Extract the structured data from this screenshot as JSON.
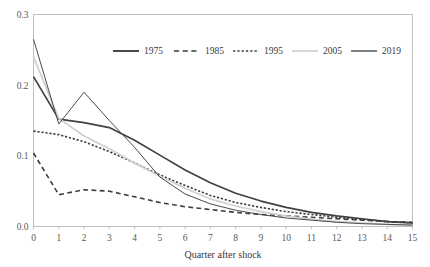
{
  "chart_data": {
    "type": "line",
    "title": "",
    "xlabel": "Quarter after shock",
    "ylabel": "",
    "xlim": [
      0,
      15
    ],
    "ylim": [
      0.0,
      0.3
    ],
    "grid": false,
    "legend_position": "top-center",
    "x": [
      0,
      1,
      2,
      3,
      4,
      5,
      6,
      7,
      8,
      9,
      10,
      11,
      12,
      13,
      14,
      15
    ],
    "xtick_labels": [
      "0",
      "1",
      "2",
      "3",
      "4",
      "5",
      "6",
      "7",
      "8",
      "9",
      "10",
      "11",
      "12",
      "13",
      "14",
      "15"
    ],
    "ytick_labels": [
      "0.0",
      "0.1",
      "0.2",
      "0.3"
    ],
    "ytick_values": [
      0.0,
      0.1,
      0.2,
      0.3
    ],
    "series": [
      {
        "name": "1975",
        "style": "solid",
        "color": "#404040",
        "width": 1.7,
        "values": [
          0.212,
          0.152,
          0.147,
          0.14,
          0.122,
          0.101,
          0.08,
          0.062,
          0.047,
          0.036,
          0.027,
          0.02,
          0.015,
          0.011,
          0.007,
          0.005
        ]
      },
      {
        "name": "1985",
        "style": "dashed",
        "color": "#3d3d3d",
        "width": 1.6,
        "values": [
          0.104,
          0.045,
          0.052,
          0.05,
          0.042,
          0.034,
          0.028,
          0.024,
          0.02,
          0.017,
          0.015,
          0.013,
          0.011,
          0.009,
          0.007,
          0.006
        ]
      },
      {
        "name": "1995",
        "style": "dotted",
        "color": "#3d3d3d",
        "width": 1.6,
        "values": [
          0.135,
          0.13,
          0.12,
          0.106,
          0.09,
          0.073,
          0.058,
          0.044,
          0.034,
          0.027,
          0.021,
          0.017,
          0.013,
          0.01,
          0.007,
          0.005
        ]
      },
      {
        "name": "2005",
        "style": "solid",
        "color": "#cfcfcf",
        "width": 1.7,
        "values": [
          0.24,
          0.153,
          0.128,
          0.11,
          0.09,
          0.071,
          0.054,
          0.039,
          0.029,
          0.021,
          0.015,
          0.01,
          0.007,
          0.005,
          0.003,
          0.002
        ]
      },
      {
        "name": "2019",
        "style": "solid",
        "color": "#4a4a4a",
        "width": 1.0,
        "values": [
          0.265,
          0.145,
          0.19,
          0.15,
          0.112,
          0.07,
          0.046,
          0.032,
          0.023,
          0.017,
          0.012,
          0.009,
          0.006,
          0.004,
          0.003,
          0.002
        ]
      }
    ],
    "legend": [
      {
        "label": "1975",
        "style": "solid",
        "color": "#404040",
        "width": 1.9
      },
      {
        "label": "1985",
        "style": "dashed",
        "color": "#3d3d3d",
        "width": 1.7
      },
      {
        "label": "1995",
        "style": "dotted",
        "color": "#3d3d3d",
        "width": 1.7
      },
      {
        "label": "2005",
        "style": "solid",
        "color": "#cfcfcf",
        "width": 1.7
      },
      {
        "label": "2019",
        "style": "solid",
        "color": "#4a4a4a",
        "width": 1.4
      }
    ]
  },
  "axis": {
    "frame_color": "#bfbfbf",
    "background": "#ffffff"
  }
}
